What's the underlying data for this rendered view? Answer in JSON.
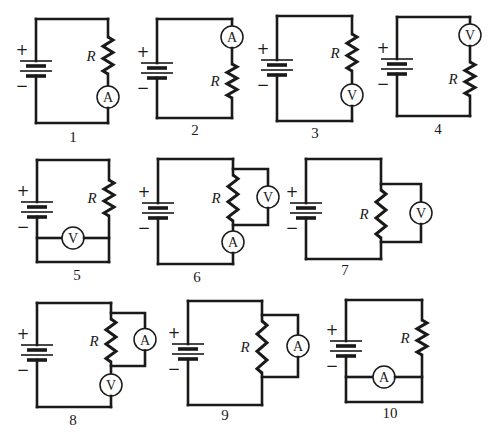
{
  "figure": {
    "resistor_label": "R",
    "battery_positive_sign": "+",
    "battery_negative_sign": "−",
    "meter_symbols": {
      "ammeter": "A",
      "voltmeter": "V"
    },
    "circuits": [
      {
        "number": "1",
        "description": "Ammeter in series, below resistor",
        "components": [
          {
            "type": "battery"
          },
          {
            "type": "resistor"
          },
          {
            "type": "ammeter",
            "connection": "series"
          }
        ]
      },
      {
        "number": "2",
        "description": "Ammeter in series, above resistor",
        "components": [
          {
            "type": "battery"
          },
          {
            "type": "ammeter",
            "connection": "series"
          },
          {
            "type": "resistor"
          }
        ]
      },
      {
        "number": "3",
        "description": "Voltmeter in series, below resistor",
        "components": [
          {
            "type": "battery"
          },
          {
            "type": "resistor"
          },
          {
            "type": "voltmeter",
            "connection": "series"
          }
        ]
      },
      {
        "number": "4",
        "description": "Voltmeter in series, above resistor",
        "components": [
          {
            "type": "battery"
          },
          {
            "type": "voltmeter",
            "connection": "series"
          },
          {
            "type": "resistor"
          }
        ]
      },
      {
        "number": "5",
        "description": "Voltmeter in parallel with bottom wire (short)",
        "components": [
          {
            "type": "battery"
          },
          {
            "type": "resistor"
          },
          {
            "type": "voltmeter",
            "connection": "parallel-with-wire"
          }
        ]
      },
      {
        "number": "6",
        "description": "Voltmeter across resistor, ammeter in series",
        "components": [
          {
            "type": "battery"
          },
          {
            "type": "resistor"
          },
          {
            "type": "voltmeter",
            "connection": "parallel-with-resistor"
          },
          {
            "type": "ammeter",
            "connection": "series"
          }
        ]
      },
      {
        "number": "7",
        "description": "Voltmeter across resistor",
        "components": [
          {
            "type": "battery"
          },
          {
            "type": "resistor"
          },
          {
            "type": "voltmeter",
            "connection": "parallel-with-resistor"
          }
        ]
      },
      {
        "number": "8",
        "description": "Ammeter across resistor, voltmeter in series",
        "components": [
          {
            "type": "battery"
          },
          {
            "type": "resistor"
          },
          {
            "type": "ammeter",
            "connection": "parallel-with-resistor"
          },
          {
            "type": "voltmeter",
            "connection": "series"
          }
        ]
      },
      {
        "number": "9",
        "description": "Ammeter across resistor",
        "components": [
          {
            "type": "battery"
          },
          {
            "type": "resistor"
          },
          {
            "type": "ammeter",
            "connection": "parallel-with-resistor"
          }
        ]
      },
      {
        "number": "10",
        "description": "Ammeter in parallel with bottom wire (short)",
        "components": [
          {
            "type": "battery"
          },
          {
            "type": "resistor"
          },
          {
            "type": "ammeter",
            "connection": "parallel-with-wire"
          }
        ]
      }
    ]
  }
}
